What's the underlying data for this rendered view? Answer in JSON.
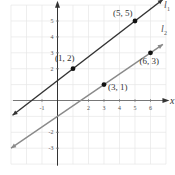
{
  "chart_data": {
    "type": "line",
    "title": "",
    "xlabel": "x",
    "ylabel": "y",
    "xlim": [
      -3,
      7
    ],
    "ylim": [
      -4,
      6
    ],
    "grid": true,
    "x_ticks": [
      -1,
      2,
      3,
      4,
      5,
      6
    ],
    "x_tick_labels": [
      "-1",
      "2",
      "3",
      "4",
      "5",
      "6"
    ],
    "y_ticks": [
      5,
      4,
      3,
      2,
      -2,
      -3
    ],
    "y_tick_labels": [
      "5",
      "4",
      "3",
      "2",
      "-2",
      "-3"
    ],
    "series": [
      {
        "name": "l1",
        "label": "l",
        "subscript": "1",
        "color": "#333333",
        "slope": 0.75,
        "intercept": 1.25,
        "x_range": [
          -2.9,
          6.8
        ],
        "points": [
          {
            "x": 1,
            "y": 2,
            "label": "(1, 2)"
          },
          {
            "x": 5,
            "y": 5,
            "label": "(5, 5)"
          }
        ]
      },
      {
        "name": "l2",
        "label": "l",
        "subscript": "2",
        "color": "#8a8a8a",
        "slope": 0.6667,
        "intercept": -1,
        "x_range": [
          -3,
          6.8
        ],
        "points": [
          {
            "x": 3,
            "y": 1,
            "label": "(3, 1)"
          },
          {
            "x": 6,
            "y": 3,
            "label": "(6, 3)"
          }
        ]
      }
    ]
  }
}
